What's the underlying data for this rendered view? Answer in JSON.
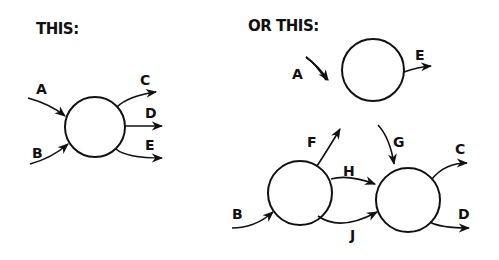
{
  "left_panel": {
    "heading": "THIS:",
    "node": {
      "cx": 95,
      "cy": 127,
      "r": 30
    },
    "edges": [
      {
        "label": "A",
        "direction": "in"
      },
      {
        "label": "B",
        "direction": "in"
      },
      {
        "label": "C",
        "direction": "out"
      },
      {
        "label": "D",
        "direction": "out"
      },
      {
        "label": "E",
        "direction": "out"
      }
    ]
  },
  "right_panel": {
    "heading": "OR THIS:",
    "nodes": [
      {
        "id": "top",
        "cx": 373,
        "cy": 70,
        "r": 31
      },
      {
        "id": "bottom-left",
        "cx": 300,
        "cy": 193,
        "r": 32
      },
      {
        "id": "bottom-right",
        "cx": 408,
        "cy": 200,
        "r": 32
      }
    ],
    "edges": [
      {
        "label": "A",
        "from": "external",
        "to": "top"
      },
      {
        "label": "E",
        "from": "top",
        "to": "external"
      },
      {
        "label": "F",
        "from": "bottom-left",
        "to": "top"
      },
      {
        "label": "G",
        "from": "top",
        "to": "bottom-right"
      },
      {
        "label": "H",
        "from": "bottom-left",
        "to": "bottom-right"
      },
      {
        "label": "J",
        "from": "bottom-left",
        "to": "bottom-right"
      },
      {
        "label": "B",
        "from": "external",
        "to": "bottom-left"
      },
      {
        "label": "C",
        "from": "bottom-right",
        "to": "external"
      },
      {
        "label": "D",
        "from": "bottom-right",
        "to": "external"
      }
    ]
  }
}
